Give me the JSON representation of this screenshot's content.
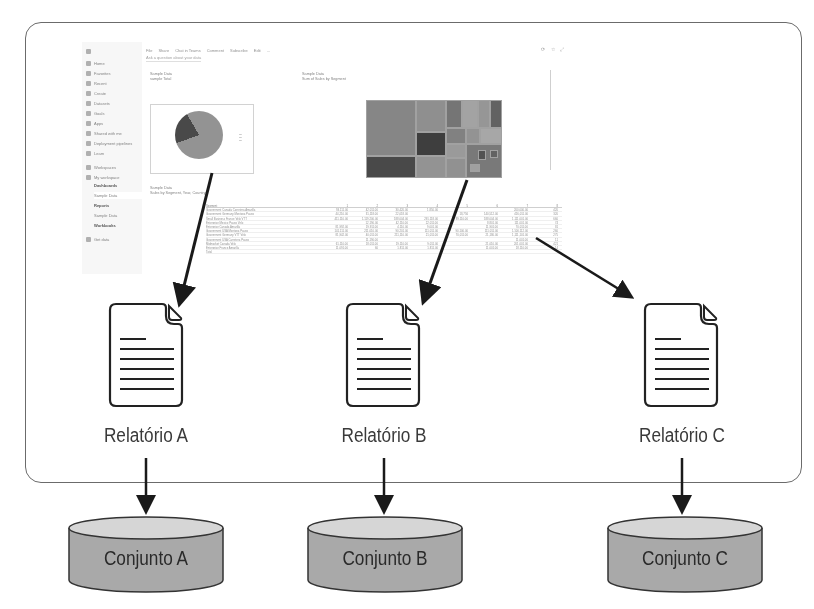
{
  "diagram": {
    "title": "",
    "frame": {
      "description": "Power BI service (screenshot containing a dashboard)"
    },
    "reports": [
      {
        "id": "A",
        "label": "Relatório A"
      },
      {
        "id": "B",
        "label": "Relatório B"
      },
      {
        "id": "C",
        "label": "Relatório C"
      }
    ],
    "datasets": [
      {
        "id": "A",
        "label": "Conjunto A"
      },
      {
        "id": "B",
        "label": "Conjunto B"
      },
      {
        "id": "C",
        "label": "Conjunto C"
      }
    ],
    "edges": [
      {
        "from": "dashboard-pie-tile",
        "to": "Relatório A"
      },
      {
        "from": "dashboard-treemap-tile",
        "to": "Relatório B"
      },
      {
        "from": "dashboard-table-tile",
        "to": "Relatório C"
      },
      {
        "from": "Relatório A",
        "to": "Conjunto A"
      },
      {
        "from": "Relatório B",
        "to": "Conjunto B"
      },
      {
        "from": "Relatório C",
        "to": "Conjunto C"
      }
    ],
    "colors": {
      "frame_border": "#6b6b6b",
      "arrow": "#1a1a1a",
      "cylinder_body": "#a9a9a9",
      "cylinder_top": "#d6d6d6",
      "text": "#2a2a2a"
    }
  },
  "screenshot": {
    "sidebar": {
      "items": [
        {
          "icon": "hamburger-icon",
          "label": ""
        },
        {
          "icon": "home-icon",
          "label": "Home"
        },
        {
          "icon": "star-icon",
          "label": "Favorites"
        },
        {
          "icon": "clock-icon",
          "label": "Recent"
        },
        {
          "icon": "plus-icon",
          "label": "Create"
        },
        {
          "icon": "database-icon",
          "label": "Datasets"
        },
        {
          "icon": "trophy-icon",
          "label": "Goals"
        },
        {
          "icon": "apps-icon",
          "label": "Apps"
        },
        {
          "icon": "share-icon",
          "label": "Shared with me"
        },
        {
          "icon": "rocket-icon",
          "label": "Deployment pipelines"
        },
        {
          "icon": "book-icon",
          "label": "Learn"
        },
        {
          "icon": "workspaces-icon",
          "label": "Workspaces"
        },
        {
          "icon": "user-icon",
          "label": "My workspace"
        },
        {
          "icon": "",
          "label": "Dashboards"
        },
        {
          "icon": "",
          "label": "Sample Data"
        },
        {
          "icon": "",
          "label": "Reports"
        },
        {
          "icon": "",
          "label": "Sample Data"
        },
        {
          "icon": "",
          "label": "Workbooks"
        },
        {
          "icon": "get-data-icon",
          "label": "Get data"
        }
      ]
    },
    "toolbar": {
      "items": [
        "File",
        "Share",
        "Chat in Teams",
        "Comment",
        "Subscribe",
        "Edit",
        "..."
      ],
      "right_icons": "⟳ ☆ ⤢"
    },
    "qa_placeholder": "Ask a question about your data",
    "tiles": [
      {
        "title": "Sample Data",
        "subtitle": "sample Total"
      },
      {
        "title": "Sample Data",
        "subtitle": "Sum of Sales by Segment"
      },
      {
        "title": "Sample Data",
        "subtitle": "Sales by Segment, Year, Country"
      }
    ],
    "table": {
      "headers": [
        "Segment",
        "1",
        "2",
        "3",
        "4",
        "5",
        "6",
        "7",
        "8"
      ],
      "rows": [
        [
          "Government Canada Carretera Amarilla",
          "93,111.00",
          "42,011.00",
          "30,420.00",
          "1,850.00",
          "",
          "",
          "200,000.00",
          "420"
        ],
        [
          "Government Germany Montana Paseo",
          "44,210.00",
          "31,118.00",
          "22,018.00",
          "",
          "18,756",
          "140,512.00",
          "416,011.00",
          "320"
        ],
        [
          "Small Business France Velo VTT",
          "411,110.00",
          "1,119,200.00",
          "188,004.00",
          "291,118.00",
          "89,110.00",
          "188,004.00",
          "1,111,001.00",
          "660"
        ],
        [
          "Enterprise Mexico Paseo Velo",
          "",
          "12,190.00",
          "42,110.00",
          "22,011.00",
          "",
          "8,801.00",
          "111,001.00",
          "74"
        ],
        [
          "Enterprise Canada Amarilla",
          "81,992.00",
          "19,911.00",
          "4,110.00",
          "9,001.00",
          "",
          "11,901.00",
          "70,011.00",
          "81"
        ],
        [
          "Government USA Montana Paseo",
          "141,111.00",
          "211,010.00",
          "90,201.00",
          "111,011.00",
          "90,100.00",
          "111,011.00",
          "1,100,112.00",
          "260"
        ],
        [
          "Government Germany VTT Velo",
          "81,942.00",
          "40,011.00",
          "211,110.00",
          "21,011.00",
          "70,011.00",
          "21,180.00",
          "1,111,101.00",
          "275"
        ],
        [
          "Government USA Carretera Paseo",
          "",
          "11,190.00",
          "",
          "",
          "",
          "",
          "11,001.00",
          "11"
        ],
        [
          "Midmarket Canada Velo",
          "61,110.00",
          "18,011.00",
          "19,110.00",
          "9,011.00",
          "",
          "21,010.00",
          "201,001.00",
          "421"
        ],
        [
          "Enterprise France Amarilla",
          "11,091.00",
          "60",
          "1,811.00",
          "1,811.00",
          "",
          "11,001.00",
          "18,110.00",
          "14"
        ],
        [
          "Total",
          "",
          "",
          "",
          "",
          "",
          "",
          "",
          ""
        ]
      ]
    }
  }
}
